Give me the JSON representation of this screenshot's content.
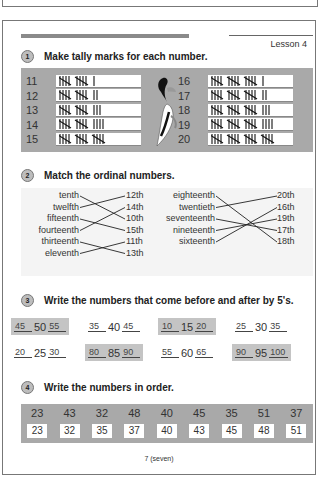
{
  "header": {
    "lesson": "Lesson 4"
  },
  "section1": {
    "number": "1",
    "title": "Make tally marks for each number.",
    "left": [
      {
        "n": "11",
        "tally": 11
      },
      {
        "n": "12",
        "tally": 12
      },
      {
        "n": "13",
        "tally": 13
      },
      {
        "n": "14",
        "tally": 14
      },
      {
        "n": "15",
        "tally": 15
      }
    ],
    "right": [
      {
        "n": "16",
        "tally": 16
      },
      {
        "n": "17",
        "tally": 17
      },
      {
        "n": "18",
        "tally": 18
      },
      {
        "n": "19",
        "tally": 19
      },
      {
        "n": "20",
        "tally": 20
      }
    ]
  },
  "section2": {
    "number": "2",
    "title": "Match the ordinal numbers.",
    "left_words": [
      "tenth",
      "twelfth",
      "fifteenth",
      "fourteenth",
      "thirteenth",
      "eleventh"
    ],
    "left_ordinals": [
      "12th",
      "14th",
      "10th",
      "15th",
      "11th",
      "13th"
    ],
    "left_matches": [
      2,
      0,
      3,
      1,
      5,
      4
    ],
    "right_words": [
      "eighteenth",
      "twentieth",
      "seventeenth",
      "nineteenth",
      "sixteenth"
    ],
    "right_ordinals": [
      "20th",
      "16th",
      "19th",
      "17th",
      "18th"
    ],
    "right_matches": [
      4,
      0,
      3,
      2,
      1
    ]
  },
  "section3": {
    "number": "3",
    "title": "Write the numbers that come before and after by 5's.",
    "rows": [
      [
        {
          "before": "45",
          "mid": "50",
          "after": "55",
          "shaded": true
        },
        {
          "before": "35",
          "mid": "40",
          "after": "45",
          "shaded": false
        },
        {
          "before": "10",
          "mid": "15",
          "after": "20",
          "shaded": true
        },
        {
          "before": "25",
          "mid": "30",
          "after": "35",
          "shaded": false
        }
      ],
      [
        {
          "before": "20",
          "mid": "25",
          "after": "30",
          "shaded": false
        },
        {
          "before": "80",
          "mid": "85",
          "after": "90",
          "shaded": true
        },
        {
          "before": "55",
          "mid": "60",
          "after": "65",
          "shaded": false
        },
        {
          "before": "90",
          "mid": "95",
          "after": "100",
          "shaded": true
        }
      ]
    ]
  },
  "section4": {
    "number": "4",
    "title": "Write the numbers in order.",
    "given": [
      "23",
      "43",
      "32",
      "48",
      "40",
      "45",
      "35",
      "51",
      "37"
    ],
    "answers": [
      "23",
      "32",
      "35",
      "37",
      "40",
      "43",
      "45",
      "48",
      "51"
    ]
  },
  "footer": {
    "page": "7 (seven)"
  }
}
